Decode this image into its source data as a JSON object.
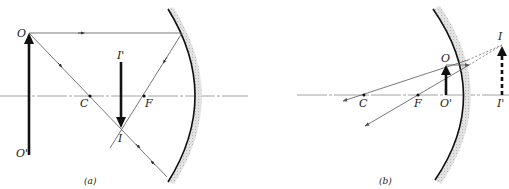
{
  "figure": {
    "panels": [
      {
        "id": "a",
        "caption": "(a)",
        "labels": {
          "object_tip": "O",
          "object_base": "O'",
          "center": "C",
          "focus": "F",
          "image_tip": "I",
          "image_base": "I'"
        },
        "description": "Object beyond C produces a real, inverted, reduced image between C and F"
      },
      {
        "id": "b",
        "caption": "(b)",
        "labels": {
          "object_tip": "O",
          "object_base": "O'",
          "center": "C",
          "focus": "F",
          "image_tip": "I",
          "image_base": "I'"
        },
        "description": "Object between F and mirror produces a virtual, upright, enlarged image behind the mirror"
      }
    ]
  },
  "colors": {
    "ink": "#1a1a1a",
    "ray": "#555555",
    "axis": "#8a8a8a",
    "mirror_backing": "#cfcfcf"
  }
}
